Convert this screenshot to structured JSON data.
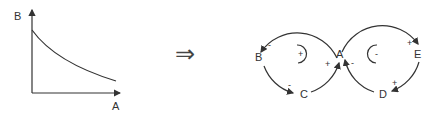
{
  "left_graph": {
    "y_axis_label": "B",
    "x_axis_label": "A",
    "curve": "monotonically decreasing (B decreases as A increases)"
  },
  "implies_symbol": "⇒",
  "loop_diagram": {
    "nodes": {
      "A": "A",
      "B": "B",
      "C": "C",
      "D": "D",
      "E": "E"
    },
    "left_loop": {
      "polarity_marker": "+",
      "links": [
        {
          "from": "A",
          "to": "B",
          "sign": "-"
        },
        {
          "from": "B",
          "to": "C",
          "sign": "-"
        },
        {
          "from": "C",
          "to": "A",
          "sign": "+"
        }
      ]
    },
    "right_loop": {
      "polarity_marker": "-",
      "links": [
        {
          "from": "A",
          "to": "E",
          "sign": "+"
        },
        {
          "from": "E",
          "to": "D",
          "sign": "+"
        },
        {
          "from": "D",
          "to": "A",
          "sign": "-"
        }
      ]
    }
  }
}
